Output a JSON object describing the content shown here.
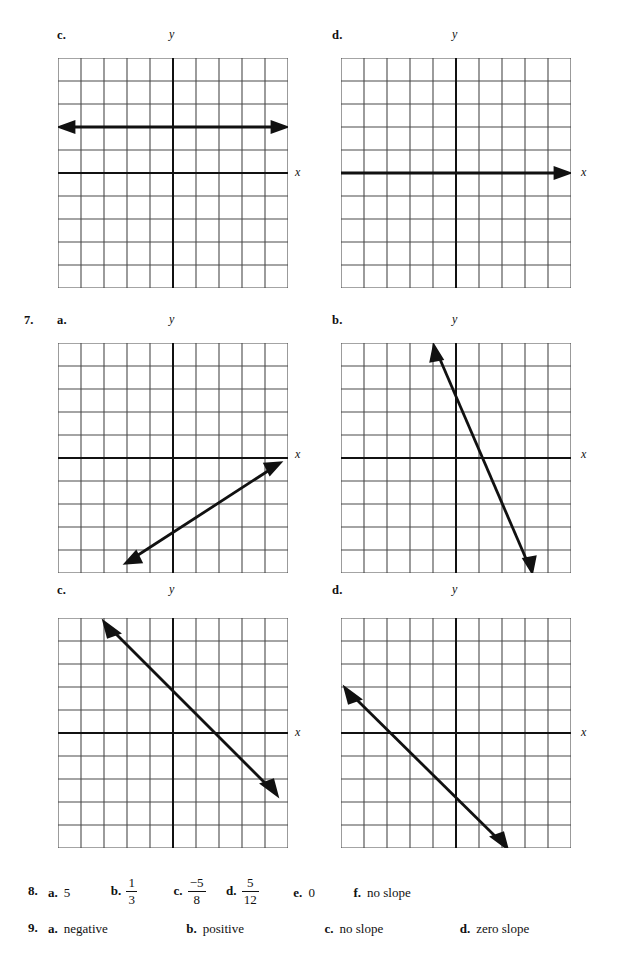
{
  "page": {
    "width": 627,
    "height": 970,
    "background": "#ffffff",
    "ink": "#1a1a1a"
  },
  "graphs": [
    {
      "id": "graph-6c",
      "problem_number": "",
      "part_label": "c.",
      "x_axis_label": "x",
      "y_axis_label": "y",
      "description": "horizontal line two units above the x-axis with arrowheads on both ends",
      "slope": "zero slope",
      "line": {
        "x1": -5,
        "y1": 2,
        "x2": 5,
        "y2": 2
      }
    },
    {
      "id": "graph-6d",
      "problem_number": "",
      "part_label": "d.",
      "x_axis_label": "x",
      "y_axis_label": "y",
      "description": "horizontal line lying on the x-axis with arrowheads on both ends",
      "slope": "zero slope",
      "line": {
        "x1": -5,
        "y1": 0,
        "x2": 5,
        "y2": 0
      }
    },
    {
      "id": "graph-7a",
      "problem_number": "7.",
      "part_label": "a.",
      "x_axis_label": "x",
      "y_axis_label": "y",
      "description": "line with positive slope drawn below the x-axis, rising left to right",
      "slope": "positive",
      "line": {
        "x1": -2,
        "y1": -5,
        "x2": 4,
        "y2": -1
      }
    },
    {
      "id": "graph-7b",
      "problem_number": "",
      "part_label": "b.",
      "x_axis_label": "x",
      "y_axis_label": "y",
      "description": "steep line with negative slope crossing the y-axis above the origin",
      "slope": "negative",
      "line": {
        "x1": -1,
        "y1": 5,
        "x2": 3,
        "y2": -5
      }
    },
    {
      "id": "graph-7c",
      "problem_number": "",
      "part_label": "c.",
      "x_axis_label": "x",
      "y_axis_label": "y",
      "description": "line of slope negative one passing near the origin",
      "slope": "negative",
      "line": {
        "x1": -4,
        "y1": 5,
        "x2": 5,
        "y2": -4
      }
    },
    {
      "id": "graph-7d",
      "problem_number": "",
      "part_label": "d.",
      "x_axis_label": "x",
      "y_axis_label": "y",
      "description": "line of slope negative one shifted down and to the left of the origin",
      "slope": "negative",
      "line": {
        "x1": -5,
        "y1": 2,
        "x2": 1,
        "y2": -4
      }
    }
  ],
  "answers": {
    "line8": {
      "number": "8.",
      "items": [
        {
          "key": "a.",
          "value": "5",
          "type": "text"
        },
        {
          "key": "b.",
          "numerator": "1",
          "denominator": "3",
          "type": "fraction"
        },
        {
          "key": "c.",
          "numerator": "−5",
          "denominator": "8",
          "type": "fraction"
        },
        {
          "key": "d.",
          "numerator": "5",
          "denominator": "12",
          "type": "fraction"
        },
        {
          "key": "e.",
          "value": "0",
          "type": "text"
        },
        {
          "key": "f.",
          "value": "no slope",
          "type": "text"
        }
      ]
    },
    "line9": {
      "number": "9.",
      "items": [
        {
          "key": "a.",
          "value": "negative",
          "type": "text"
        },
        {
          "key": "b.",
          "value": "positive",
          "type": "text"
        },
        {
          "key": "c.",
          "value": "no slope",
          "type": "text"
        },
        {
          "key": "d.",
          "value": "zero slope",
          "type": "text"
        }
      ]
    }
  },
  "grid": {
    "cells_x": 10,
    "cells_y": 10,
    "cell_px": 23,
    "grid_color": "#4a4a4a",
    "axis_color": "#111111",
    "line_color": "#111111"
  }
}
